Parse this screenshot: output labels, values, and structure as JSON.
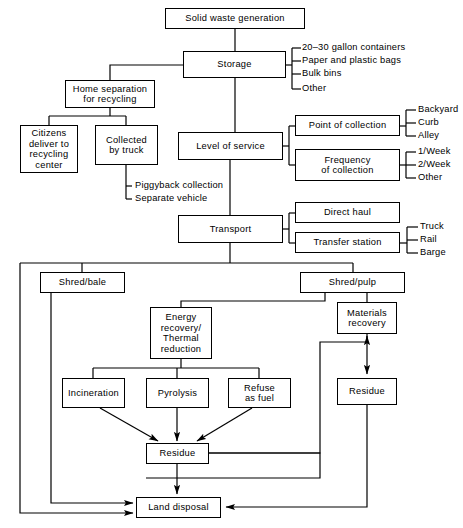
{
  "diagram": {
    "line_color": "#000000",
    "background": "#ffffff",
    "nodes": [
      {
        "id": "solid_waste_generation",
        "label": "Solid waste generation",
        "x": 165,
        "y": 8,
        "w": 140,
        "h": 21
      },
      {
        "id": "storage",
        "label": "Storage",
        "x": 183,
        "y": 51,
        "w": 103,
        "h": 27
      },
      {
        "id": "home_separation",
        "label": "Home separation\nfor recycling",
        "x": 65,
        "y": 80,
        "w": 90,
        "h": 28
      },
      {
        "id": "citizens_deliver",
        "label": "Citizens\ndeliver to\nrecycling\ncenter",
        "x": 20,
        "y": 125,
        "w": 58,
        "h": 48
      },
      {
        "id": "collected_by_truck",
        "label": "Collected\nby truck",
        "x": 95,
        "y": 125,
        "w": 63,
        "h": 40
      },
      {
        "id": "level_of_service",
        "label": "Level of service",
        "x": 178,
        "y": 132,
        "w": 105,
        "h": 28
      },
      {
        "id": "point_of_collection",
        "label": "Point of collection",
        "x": 295,
        "y": 115,
        "w": 105,
        "h": 21
      },
      {
        "id": "frequency_of_collection",
        "label": "Frequency\nof collection",
        "x": 295,
        "y": 149,
        "w": 105,
        "h": 32
      },
      {
        "id": "transport",
        "label": "Transport",
        "x": 178,
        "y": 215,
        "w": 105,
        "h": 28
      },
      {
        "id": "direct_haul",
        "label": "Direct haul",
        "x": 295,
        "y": 202,
        "w": 105,
        "h": 21
      },
      {
        "id": "transfer_station",
        "label": "Transfer station",
        "x": 295,
        "y": 232,
        "w": 105,
        "h": 21
      },
      {
        "id": "shred_bale",
        "label": "Shred/bale",
        "x": 40,
        "y": 272,
        "w": 85,
        "h": 21
      },
      {
        "id": "shred_pulp",
        "label": "Shred/pulp",
        "x": 300,
        "y": 272,
        "w": 105,
        "h": 21
      },
      {
        "id": "energy_recovery",
        "label": "Energy\nrecovery/\nThermal\nreduction",
        "x": 150,
        "y": 307,
        "w": 62,
        "h": 52
      },
      {
        "id": "materials_recovery",
        "label": "Materials\nrecovery",
        "x": 337,
        "y": 302,
        "w": 60,
        "h": 32
      },
      {
        "id": "incineration",
        "label": "Incineration",
        "x": 62,
        "y": 378,
        "w": 63,
        "h": 30
      },
      {
        "id": "pyrolysis",
        "label": "Pyrolysis",
        "x": 146,
        "y": 378,
        "w": 63,
        "h": 30
      },
      {
        "id": "refuse_as_fuel",
        "label": "Refuse\nas fuel",
        "x": 228,
        "y": 378,
        "w": 63,
        "h": 30
      },
      {
        "id": "residue_right",
        "label": "Residue",
        "x": 337,
        "y": 378,
        "w": 60,
        "h": 27
      },
      {
        "id": "residue_center",
        "label": "Residue",
        "x": 146,
        "y": 443,
        "w": 63,
        "h": 21
      },
      {
        "id": "land_disposal",
        "label": "Land disposal",
        "x": 136,
        "y": 497,
        "w": 85,
        "h": 21
      }
    ],
    "leaf_labels": [
      {
        "id": "storage_opt_1",
        "group": "storage",
        "text": "20–30 gallon containers",
        "x": 302,
        "y": 48
      },
      {
        "id": "storage_opt_2",
        "group": "storage",
        "text": "Paper and plastic bags",
        "x": 302,
        "y": 61
      },
      {
        "id": "storage_opt_3",
        "group": "storage",
        "text": "Bulk bins",
        "x": 302,
        "y": 74
      },
      {
        "id": "storage_opt_4",
        "group": "storage",
        "text": "Other",
        "x": 302,
        "y": 87
      },
      {
        "id": "poc_opt_1",
        "group": "point_of_collection",
        "text": "Backyard",
        "x": 418,
        "y": 110
      },
      {
        "id": "poc_opt_2",
        "group": "point_of_collection",
        "text": "Curb",
        "x": 418,
        "y": 122
      },
      {
        "id": "poc_opt_3",
        "group": "point_of_collection",
        "text": "Alley",
        "x": 418,
        "y": 134
      },
      {
        "id": "freq_opt_1",
        "group": "frequency_of_collection",
        "text": "1/Week",
        "x": 418,
        "y": 150
      },
      {
        "id": "freq_opt_2",
        "group": "frequency_of_collection",
        "text": "2/Week",
        "x": 418,
        "y": 163
      },
      {
        "id": "freq_opt_3",
        "group": "frequency_of_collection",
        "text": "Other",
        "x": 418,
        "y": 176
      },
      {
        "id": "truck_opt_1",
        "group": "transfer_station",
        "text": "Truck",
        "x": 420,
        "y": 226
      },
      {
        "id": "truck_opt_2",
        "group": "transfer_station",
        "text": "Rail",
        "x": 420,
        "y": 238
      },
      {
        "id": "truck_opt_3",
        "group": "transfer_station",
        "text": "Barge",
        "x": 420,
        "y": 250
      },
      {
        "id": "collect_opt_1",
        "group": "collected_by_truck",
        "text": "Piggyback collection",
        "x": 133,
        "y": 186
      },
      {
        "id": "collect_opt_2",
        "group": "collected_by_truck",
        "text": "Separate vehicle",
        "x": 133,
        "y": 199
      }
    ],
    "edges": [
      {
        "from": "solid_waste_generation",
        "to": "storage",
        "kind": "plain"
      },
      {
        "from": "storage",
        "to": "home_separation",
        "kind": "plain"
      },
      {
        "from": "storage",
        "to": "level_of_service",
        "kind": "plain"
      },
      {
        "from": "home_separation",
        "to": "citizens_deliver",
        "kind": "plain"
      },
      {
        "from": "home_separation",
        "to": "collected_by_truck",
        "kind": "plain"
      },
      {
        "from": "level_of_service",
        "to": "point_of_collection",
        "kind": "plain"
      },
      {
        "from": "level_of_service",
        "to": "frequency_of_collection",
        "kind": "plain"
      },
      {
        "from": "level_of_service",
        "to": "transport",
        "kind": "plain"
      },
      {
        "from": "transport",
        "to": "direct_haul",
        "kind": "plain"
      },
      {
        "from": "transport",
        "to": "transfer_station",
        "kind": "plain"
      },
      {
        "from": "transport",
        "to": "shred_bale",
        "kind": "plain"
      },
      {
        "from": "transport",
        "to": "shred_pulp",
        "kind": "plain"
      },
      {
        "from": "transport",
        "to": "land_disposal",
        "kind": "arrow"
      },
      {
        "from": "shred_bale",
        "to": "land_disposal",
        "kind": "arrow"
      },
      {
        "from": "shred_pulp",
        "to": "energy_recovery",
        "kind": "plain"
      },
      {
        "from": "shred_pulp",
        "to": "materials_recovery",
        "kind": "plain"
      },
      {
        "from": "energy_recovery",
        "to": "incineration",
        "kind": "plain"
      },
      {
        "from": "energy_recovery",
        "to": "pyrolysis",
        "kind": "plain"
      },
      {
        "from": "energy_recovery",
        "to": "refuse_as_fuel",
        "kind": "plain"
      },
      {
        "from": "incineration",
        "to": "residue_center",
        "kind": "arrow"
      },
      {
        "from": "pyrolysis",
        "to": "residue_center",
        "kind": "arrow"
      },
      {
        "from": "refuse_as_fuel",
        "to": "residue_center",
        "kind": "arrow"
      },
      {
        "from": "materials_recovery",
        "to": "residue_right",
        "kind": "arrow"
      },
      {
        "from": "residue_center",
        "to": "materials_recovery",
        "kind": "arrow"
      },
      {
        "from": "residue_center",
        "to": "land_disposal",
        "kind": "arrow"
      },
      {
        "from": "residue_right",
        "to": "land_disposal",
        "kind": "arrow"
      }
    ]
  },
  "page_artifact": {
    "ghost_text": ""
  }
}
